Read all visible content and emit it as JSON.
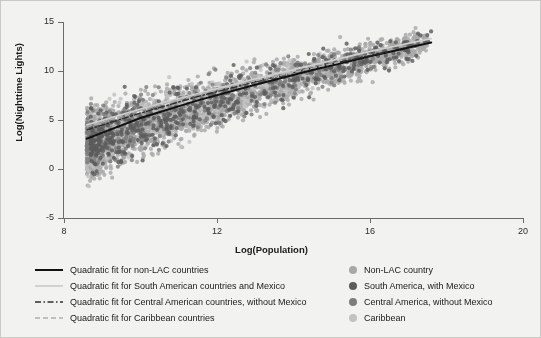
{
  "chart_data": {
    "type": "scatter",
    "title": "",
    "xlabel": "Log(Population)",
    "ylabel": "Log(Nighttime Lights)",
    "xlim": [
      8,
      20
    ],
    "ylim": [
      -5,
      15
    ],
    "xticks": [
      "8",
      "12",
      "16",
      "20"
    ],
    "yticks": [
      "15",
      "10",
      "5",
      "0",
      "-5"
    ],
    "xtick_values": [
      8,
      12,
      16,
      20
    ],
    "ytick_values": [
      15,
      10,
      5,
      0,
      -5
    ],
    "grid": false,
    "legend_position": "below-plot",
    "series": [
      {
        "name": "Non-LAC country",
        "marker": "circle",
        "color": "#a8a8a8",
        "n_points": 2600,
        "x_range": [
          8.6,
          17.5
        ],
        "y_range": [
          -5.0,
          14.0
        ]
      },
      {
        "name": "South America, with Mexico",
        "marker": "circle",
        "color": "#5c5c5c",
        "n_points": 520,
        "x_range": [
          8.7,
          17.6
        ],
        "y_range": [
          -3.5,
          13.8
        ]
      },
      {
        "name": "Central America, without Mexico",
        "marker": "circle",
        "color": "#7d7d7d",
        "n_points": 430,
        "x_range": [
          8.6,
          16.2
        ],
        "y_range": [
          -4.5,
          12.5
        ]
      },
      {
        "name": "Caribbean",
        "marker": "circle",
        "color": "#c2c2c2",
        "n_points": 380,
        "x_range": [
          8.6,
          15.0
        ],
        "y_range": [
          -5.0,
          12.0
        ]
      }
    ],
    "fits": [
      {
        "name": "Quadratic fit for non-LAC countries",
        "style": "solid",
        "color": "#111111",
        "width": 2.0,
        "x_start": 8.6,
        "x_end": 17.6,
        "points": [
          [
            8.6,
            3.1
          ],
          [
            10.0,
            5.2
          ],
          [
            11.5,
            7.0
          ],
          [
            13.0,
            8.6
          ],
          [
            14.5,
            10.1
          ],
          [
            16.0,
            11.5
          ],
          [
            17.6,
            12.9
          ]
        ]
      },
      {
        "name": "Quadratic fit for South American countries and Mexico",
        "style": "solid",
        "color": "#cfcfcf",
        "width": 1.8,
        "x_start": 8.6,
        "x_end": 17.6,
        "points": [
          [
            8.6,
            4.5
          ],
          [
            10.0,
            6.1
          ],
          [
            11.5,
            7.7
          ],
          [
            13.0,
            9.2
          ],
          [
            14.5,
            10.6
          ],
          [
            16.0,
            12.0
          ],
          [
            17.6,
            13.3
          ]
        ]
      },
      {
        "name": "Quadratic fit for Central American countries, without Mexico",
        "style": "dashdot",
        "color": "#2f2f2f",
        "width": 1.4,
        "x_start": 8.6,
        "x_end": 16.5,
        "points": [
          [
            8.6,
            4.0
          ],
          [
            10.0,
            5.7
          ],
          [
            11.5,
            7.4
          ],
          [
            13.0,
            8.9
          ],
          [
            14.5,
            10.3
          ],
          [
            16.5,
            12.0
          ]
        ]
      },
      {
        "name": "Quadratic fit for Caribbean countries",
        "style": "dashed",
        "color": "#b0b0b0",
        "width": 1.4,
        "x_start": 8.6,
        "x_end": 15.2,
        "points": [
          [
            8.6,
            4.3
          ],
          [
            10.0,
            6.0
          ],
          [
            11.5,
            7.6
          ],
          [
            13.0,
            9.0
          ],
          [
            15.2,
            10.9
          ]
        ]
      }
    ],
    "legend_fit_entries": [
      "Quadratic fit for non-LAC countries",
      "Quadratic fit for South American countries and Mexico",
      "Quadratic fit for Central American countries, without Mexico",
      "Quadratic fit for Caribbean countries"
    ],
    "legend_marker_entries": [
      "Non-LAC country",
      "South America, with Mexico",
      "Central America, without Mexico",
      "Caribbean"
    ]
  },
  "colors": {
    "background": "#f2f2f0",
    "border": "#c9c9c6",
    "axis": "#6b6b6b",
    "text": "#1a1a1a"
  }
}
